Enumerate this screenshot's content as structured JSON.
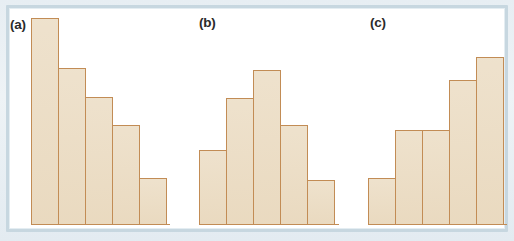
{
  "figure": {
    "background_color": "#ffffff",
    "page_color": "#e9f0f4",
    "frame_color": "#c7d7e0",
    "bar_fill_color": "#ebdcc3",
    "bar_stroke_color": "#c28c55"
  },
  "panels": [
    {
      "label": "(a)",
      "label_x": 10,
      "label_y": 18,
      "left": 31,
      "bar_width": 27.6,
      "shape": "decreasing"
    },
    {
      "label": "(b)",
      "label_x": 199,
      "label_y": 16,
      "left": 199,
      "bar_width": 27.8,
      "shape": "unimodal-symmetric"
    },
    {
      "label": "(c)",
      "label_x": 370,
      "label_y": 16,
      "left": 368,
      "bar_width": 27.6,
      "shape": "increasing-left-skewed"
    }
  ],
  "chart_data": {
    "type": "bar",
    "title": "",
    "subtitle": "",
    "xlabel": "",
    "ylabel": "",
    "grid": false,
    "legend": "none",
    "axis_ranges": {
      "ylim": [
        0,
        210
      ]
    },
    "panel_count": 3,
    "bars_per_panel": 5,
    "charts": [
      {
        "panel": "(a)",
        "type": "bar",
        "title": "(a)",
        "description": "Histogram with bars decreasing from left to right (right-skewed / descending shape)",
        "categories": [
          "1",
          "2",
          "3",
          "4",
          "5"
        ],
        "values": [
          207,
          157,
          128,
          100,
          47
        ],
        "xlabel": "",
        "ylabel": "",
        "ylim": [
          0,
          210
        ]
      },
      {
        "panel": "(b)",
        "type": "bar",
        "title": "(b)",
        "description": "Histogram with a single central peak (unimodal, roughly symmetric shape)",
        "categories": [
          "1",
          "2",
          "3",
          "4",
          "5"
        ],
        "values": [
          75,
          127,
          155,
          100,
          45
        ],
        "xlabel": "",
        "ylabel": "",
        "ylim": [
          0,
          210
        ]
      },
      {
        "panel": "(c)",
        "type": "bar",
        "title": "(c)",
        "description": "Histogram with bars increasing from left to right (left-skewed / ascending shape)",
        "categories": [
          "1",
          "2",
          "3",
          "4",
          "5"
        ],
        "values": [
          47,
          95,
          95,
          145,
          168
        ],
        "xlabel": "",
        "ylabel": "",
        "ylim": [
          0,
          210
        ]
      }
    ]
  }
}
